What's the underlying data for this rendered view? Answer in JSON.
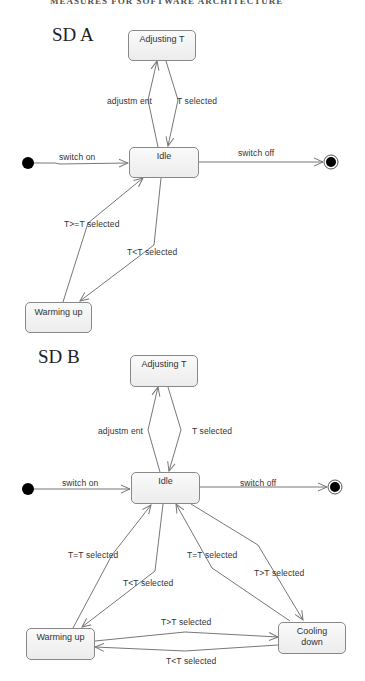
{
  "header": {
    "cut_off_text": "MEASURES FOR SOFTWARE ARCHITECTURE"
  },
  "diagrams": [
    {
      "title": "SD A",
      "states": {
        "adjusting": "Adjusting T",
        "idle": "Idle",
        "warming": "Warming up"
      },
      "transitions": {
        "adjustment": "adjustm ent",
        "t_selected": "T selected",
        "switch_on": "switch on",
        "switch_off": "switch off",
        "warm_to_idle": "T>=T selected",
        "idle_to_warm": "T<T selected"
      }
    },
    {
      "title": "SD B",
      "states": {
        "adjusting": "Adjusting T",
        "idle": "Idle",
        "warming": "Warming up",
        "cooling": "Cooling down"
      },
      "transitions": {
        "adjustment": "adjustm ent",
        "t_selected": "T selected",
        "switch_on": "switch on",
        "switch_off": "switch off",
        "warm_to_idle": "T=T selected",
        "idle_to_warm": "T<T selected",
        "cool_to_idle": "T=T selected",
        "idle_to_cool": "T>T selected",
        "warm_to_cool": "T>T selected",
        "cool_to_warm": "T<T selected"
      }
    }
  ],
  "colors": {
    "line": "#777777",
    "state_border": "#888888",
    "state_fill": "#f2f2f2",
    "node": "#000000"
  }
}
